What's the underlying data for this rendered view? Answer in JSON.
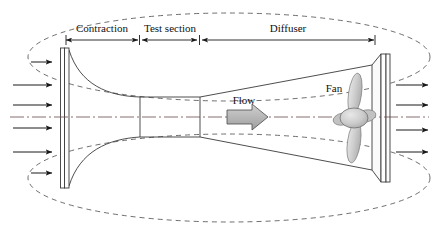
{
  "figure": {
    "type": "open-circuit-wind-tunnel-diagram",
    "background_color": "#ffffff",
    "line_color": "#3a3a3a",
    "text_color": "#111111"
  },
  "dimensions": {
    "contraction_label": "Contraction",
    "test_section_label": "Test section",
    "diffuser_label": "Diffuser"
  },
  "annotations": {
    "flow_label": "Flow",
    "fan_label": "Fan"
  },
  "components": {
    "inlet_plate": "inlet-flange-plate",
    "contraction_cone": "contraction-cone",
    "test_section": "test-section-duct",
    "diffuser_cone": "diffuser-cone",
    "outlet_plate": "outlet-flange-plate",
    "fan": "axial-fan",
    "centerline": "centerline-axis",
    "inlet_streamlines_count": "6",
    "outlet_streamlines_count": "4"
  },
  "colors": {
    "fan_fill": "#c9c9c9",
    "flow_arrow_fill": "#b9b9b9",
    "outline": "#3a3a3a",
    "dashed": "#4a4a4a"
  }
}
